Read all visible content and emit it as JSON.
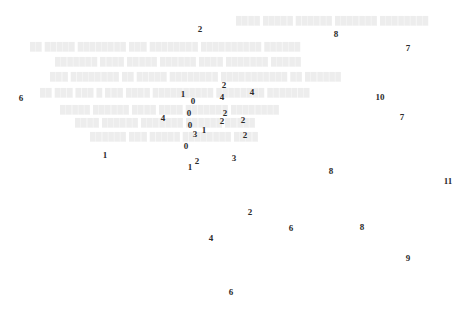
{
  "figure": {
    "title": "",
    "background_color": "#ffffff",
    "label_color": "#2b2b2b",
    "ghost_color": "#ededed",
    "width": 456,
    "height": 330
  },
  "chart_data": {
    "type": "scatter",
    "title": "",
    "xlabel": "",
    "ylabel": "",
    "xlim": [
      0,
      456
    ],
    "ylim": [
      0,
      330
    ],
    "grid": false,
    "legend": null,
    "note": "Text-marker scatter: each point is drawn as its integer cluster label at its (x, y) pixel position.",
    "point_label_field": "label",
    "points": [
      {
        "label": "2",
        "x": 200,
        "y": 29
      },
      {
        "label": "8",
        "x": 336,
        "y": 34
      },
      {
        "label": "7",
        "x": 408,
        "y": 48
      },
      {
        "label": "2",
        "x": 224,
        "y": 85
      },
      {
        "label": "4",
        "x": 252,
        "y": 92
      },
      {
        "label": "1",
        "x": 183,
        "y": 94
      },
      {
        "label": "6",
        "x": 21,
        "y": 98
      },
      {
        "label": "4",
        "x": 222,
        "y": 97
      },
      {
        "label": "10",
        "x": 380,
        "y": 97
      },
      {
        "label": "0",
        "x": 193,
        "y": 101
      },
      {
        "label": "0",
        "x": 189,
        "y": 113
      },
      {
        "label": "2",
        "x": 225,
        "y": 113
      },
      {
        "label": "4",
        "x": 163,
        "y": 118
      },
      {
        "label": "7",
        "x": 402,
        "y": 117
      },
      {
        "label": "2",
        "x": 222,
        "y": 121
      },
      {
        "label": "2",
        "x": 243,
        "y": 120
      },
      {
        "label": "0",
        "x": 190,
        "y": 125
      },
      {
        "label": "1",
        "x": 204,
        "y": 130
      },
      {
        "label": "2",
        "x": 245,
        "y": 135
      },
      {
        "label": "3",
        "x": 195,
        "y": 134
      },
      {
        "label": "0",
        "x": 186,
        "y": 146
      },
      {
        "label": "1",
        "x": 105,
        "y": 155
      },
      {
        "label": "2",
        "x": 197,
        "y": 161
      },
      {
        "label": "3",
        "x": 234,
        "y": 158
      },
      {
        "label": "1",
        "x": 190,
        "y": 167
      },
      {
        "label": "8",
        "x": 331,
        "y": 171
      },
      {
        "label": "11",
        "x": 448,
        "y": 181
      },
      {
        "label": "2",
        "x": 250,
        "y": 212
      },
      {
        "label": "6",
        "x": 291,
        "y": 228
      },
      {
        "label": "8",
        "x": 362,
        "y": 227
      },
      {
        "label": "4",
        "x": 211,
        "y": 238
      },
      {
        "label": "9",
        "x": 408,
        "y": 258
      },
      {
        "label": "6",
        "x": 231,
        "y": 292
      }
    ],
    "label_counts": {
      "0": 4,
      "1": 4,
      "2": 8,
      "3": 2,
      "4": 4,
      "6": 3,
      "7": 2,
      "8": 3,
      "9": 1,
      "10": 1,
      "11": 1
    }
  },
  "background_watermark": {
    "description": "very faint blurred grey text rendered behind the data labels; individual words are not legible at this resolution",
    "lines": [
      {
        "x": 236,
        "y": 16,
        "text": "████ █████ ██████ ███████ ████████"
      },
      {
        "x": 30,
        "y": 42,
        "text": "██ █████ ████████ ███  ████████  ██████████ ██████"
      },
      {
        "x": 55,
        "y": 57,
        "text": "███████  ████  █████   ██████ ████ ███████ █████"
      },
      {
        "x": 50,
        "y": 72,
        "text": "███ ████████  ██   █████  ████████ ███████████ ██ ██████"
      },
      {
        "x": 40,
        "y": 88,
        "text": "██  ███ ███ █  ███ ████ ██████████  ████████ ███████"
      },
      {
        "x": 60,
        "y": 105,
        "text": "█████ ██████ ████   ████ ███████ ████████"
      },
      {
        "x": 75,
        "y": 118,
        "text": "████ ██████  ███████ ██████  █████"
      },
      {
        "x": 90,
        "y": 132,
        "text": "██████ ███  █████ ████████ ████"
      }
    ]
  }
}
